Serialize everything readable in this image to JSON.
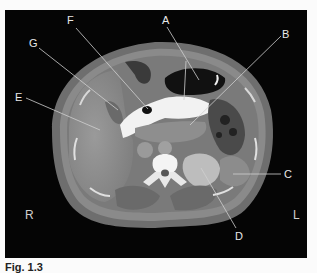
{
  "figure": {
    "labels": {
      "A": "A",
      "B": "B",
      "C": "C",
      "D": "D",
      "E": "E",
      "F": "F",
      "G": "G"
    },
    "orientation": {
      "right": "R",
      "left": "L"
    }
  },
  "caption": "Fig. 1.3"
}
